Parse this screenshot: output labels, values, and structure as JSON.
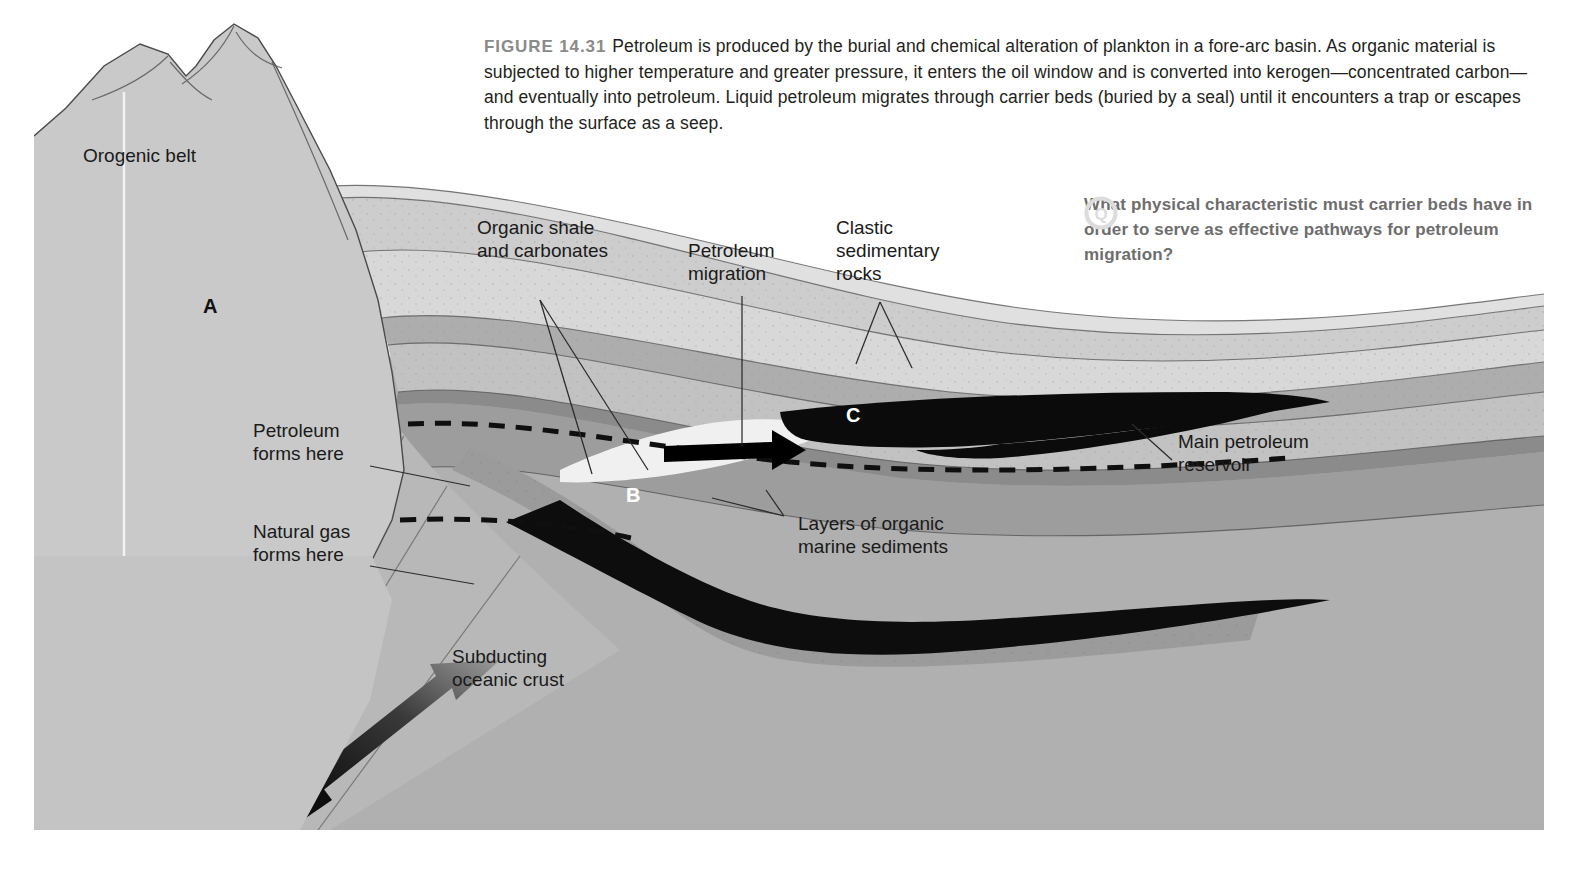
{
  "figure": {
    "number_label": "FIGURE 14.31",
    "caption": "Petroleum is produced by the burial and chemical alteration of plankton in a fore-arc basin. As organic material is subjected to higher temperature and greater pressure, it enters the oil window and is converted into kerogen—concentrated carbon—and eventually into petroleum. Liquid petroleum migrates through carrier beds (buried by a seal) until it encounters a trap or escapes through the surface as a seep."
  },
  "question": {
    "icon": "question-circle-icon",
    "icon_letter": "Q",
    "text": "What physical characteristic must carrier beds have in order to serve as effective pathways for petroleum migration?"
  },
  "labels": {
    "orogenic_belt": "Orogenic belt",
    "organic_shale_l1": "Organic shale",
    "organic_shale_l2": "and carbonates",
    "petroleum_migration_l1": "Petroleum",
    "petroleum_migration_l2": "migration",
    "clastic_l1": "Clastic",
    "clastic_l2": "sedimentary",
    "clastic_l3": "rocks",
    "petroleum_forms_l1": "Petroleum",
    "petroleum_forms_l2": "forms here",
    "natural_gas_l1": "Natural gas",
    "natural_gas_l2": "forms here",
    "layers_organic_l1": "Layers of organic",
    "layers_organic_l2": "marine sediments",
    "main_reservoir_l1": "Main petroleum",
    "main_reservoir_l2": "reservoir",
    "subducting_l1": "Subducting",
    "subducting_l2": "oceanic crust"
  },
  "markers": {
    "a": "A",
    "b": "B",
    "c": "C"
  },
  "colors": {
    "page_background": "#ffffff",
    "orogen_block": "#c9c9c9",
    "mantle_basement": "#b0b0b0",
    "sediment_light": "#e3e3e3",
    "sediment_mid": "#cfcfcf",
    "sediment_dark": "#a8a8a8",
    "organic_band": "#8f8f8f",
    "petroleum_black": "#0c0c0c",
    "oil_window_pocket": "#f2f2f2",
    "caption_text": "#231f20",
    "figure_number_gray": "#8a8a8a",
    "question_gray": "#6d6d6d",
    "leader_line": "#2b2b2b"
  }
}
